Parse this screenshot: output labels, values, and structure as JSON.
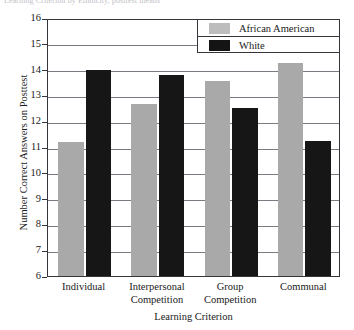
{
  "clipped_header_text": "Learning Criterion by Ethnicity, posttest means",
  "chart_data": {
    "type": "bar",
    "title": "",
    "xlabel": "Learning Criterion",
    "ylabel": "Number Correct Answers on Posttest",
    "categories": [
      "Individual",
      "Interpersonal Competition",
      "Group Competition",
      "Communal"
    ],
    "category_lines": [
      [
        "Individual"
      ],
      [
        "Interpersonal",
        "Competition"
      ],
      [
        "Group",
        "Competition"
      ],
      [
        "Communal"
      ]
    ],
    "series": [
      {
        "name": "African American",
        "color": "#a9a9a9",
        "values": [
          11.2,
          12.65,
          13.55,
          14.25
        ]
      },
      {
        "name": "White",
        "color": "#161616",
        "values": [
          14.0,
          13.8,
          12.5,
          11.25
        ]
      }
    ],
    "ylim": [
      6,
      16
    ],
    "yticks": [
      6,
      7,
      8,
      9,
      10,
      11,
      12,
      13,
      14,
      15,
      16
    ],
    "grid": true,
    "legend_position": "top-right",
    "legend_entries": [
      "African American",
      "White"
    ]
  }
}
